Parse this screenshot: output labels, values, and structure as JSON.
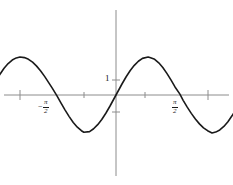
{
  "figure": {
    "background_color": "#ffffff",
    "axis_color": "#8c8c8c",
    "curve_color": "#1a1a1a",
    "text_color": "#1a1a1a",
    "width": 233,
    "height": 185
  },
  "labels": {
    "y_one": "1",
    "x_neg_half_pi_minus": "−",
    "x_neg_half_pi_num": "π",
    "x_neg_half_pi_den": "2",
    "x_pos_half_pi_num": "π",
    "x_pos_half_pi_den": "2"
  },
  "chart_data": {
    "type": "line",
    "title": "",
    "xlabel": "",
    "ylabel": "",
    "grid": false,
    "legend": null,
    "function": "y = 2.5 sin(2x)",
    "amplitude": 2.5,
    "period": "π",
    "xlim": [
      -3.15,
      3.15
    ],
    "ylim": [
      -3.9,
      4.9
    ],
    "x_tick_values": [
      -2.356,
      -0.785,
      0.785,
      2.356
    ],
    "x_tick_labels": [
      "",
      "−π/2",
      "π/2",
      ""
    ],
    "y_tick_values": [
      1,
      -1
    ],
    "y_tick_labels": [
      "1",
      ""
    ],
    "zero_crossings": [
      -3.1416,
      -1.5708,
      0,
      1.5708,
      3.1416
    ],
    "maxima": [
      {
        "x": -2.356,
        "y": 2.5
      },
      {
        "x": 0.785,
        "y": 2.5
      }
    ],
    "minima": [
      {
        "x": -0.785,
        "y": -2.5
      },
      {
        "x": 2.356,
        "y": -2.5
      }
    ],
    "x": [
      -3.05,
      -2.95,
      -2.85,
      -2.75,
      -2.65,
      -2.55,
      -2.45,
      -2.36,
      -2.25,
      -2.15,
      -2.05,
      -1.95,
      -1.85,
      -1.75,
      -1.65,
      -1.57,
      -1.45,
      -1.35,
      -1.25,
      -1.15,
      -1.05,
      -0.95,
      -0.85,
      -0.79,
      -0.65,
      -0.55,
      -0.45,
      -0.35,
      -0.25,
      -0.15,
      0,
      0.15,
      0.25,
      0.35,
      0.45,
      0.55,
      0.65,
      0.79,
      0.85,
      0.95,
      1.05,
      1.15,
      1.25,
      1.35,
      1.45,
      1.57,
      1.65,
      1.75,
      1.85,
      1.95,
      2.05,
      2.15,
      2.25,
      2.36,
      2.45,
      2.55,
      2.65,
      2.75,
      2.85,
      2.95,
      3.05
    ],
    "y": [
      0.45,
      0.93,
      1.37,
      1.76,
      2.07,
      2.3,
      2.44,
      2.5,
      2.46,
      2.35,
      2.16,
      1.9,
      1.58,
      1.21,
      0.8,
      0.47,
      -0.06,
      -0.53,
      -0.99,
      -1.42,
      -1.81,
      -2.12,
      -2.35,
      -2.45,
      -2.41,
      -2.22,
      -1.95,
      -1.61,
      -1.2,
      -0.74,
      0,
      0.74,
      1.2,
      1.61,
      1.95,
      2.22,
      2.41,
      2.5,
      2.45,
      2.35,
      2.12,
      1.81,
      1.42,
      0.99,
      0.53,
      0.06,
      -0.35,
      -0.8,
      -1.21,
      -1.58,
      -1.9,
      -2.16,
      -2.35,
      -2.5,
      -2.44,
      -2.3,
      -2.07,
      -1.76,
      -1.37,
      -0.93,
      -0.45
    ]
  }
}
